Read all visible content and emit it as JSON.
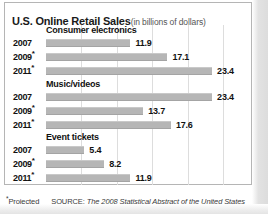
{
  "header": {
    "title_main": "U.S. Online Retail Sales",
    "title_sub": "(in billions of dollars)"
  },
  "footer": {
    "projected_star": "*",
    "projected_label": "Projected",
    "source_prefix": "SOURCE:",
    "source_title": "The 2008 Statistical Abstract of the United States"
  },
  "axis": {
    "max": 25.5,
    "gridlines": [
      5,
      10,
      15,
      20,
      25
    ]
  },
  "colors": {
    "bar": "#b6b6b6",
    "text": "#111111",
    "panel_border": "#b5b5b5",
    "gridline": "#dddddd"
  },
  "chart_data": {
    "type": "bar",
    "orientation": "horizontal",
    "xlabel": "",
    "ylabel": "",
    "unit": "billions of dollars",
    "xlim": [
      0,
      25.5
    ],
    "grid": true,
    "legend": "none",
    "source": "The 2008 Statistical Abstract of the United States",
    "note": "* Projected",
    "categories": [
      "2007",
      "2009*",
      "2011*"
    ],
    "groups": [
      {
        "name": "Consumer electronics",
        "rows": [
          {
            "year": "2007",
            "projected": false,
            "value": 11.9,
            "label": "11.9"
          },
          {
            "year": "2009",
            "projected": true,
            "value": 17.1,
            "label": "17.1"
          },
          {
            "year": "2011",
            "projected": true,
            "value": 23.4,
            "label": "23.4"
          }
        ]
      },
      {
        "name": "Music/videos",
        "rows": [
          {
            "year": "2007",
            "projected": false,
            "value": 23.4,
            "label": "23.4"
          },
          {
            "year": "2009",
            "projected": true,
            "value": 13.7,
            "label": "13.7"
          },
          {
            "year": "2011",
            "projected": true,
            "value": 17.6,
            "label": "17.6"
          }
        ]
      },
      {
        "name": "Event tickets",
        "rows": [
          {
            "year": "2007",
            "projected": false,
            "value": 5.4,
            "label": "5.4"
          },
          {
            "year": "2009",
            "projected": true,
            "value": 8.2,
            "label": "8.2"
          },
          {
            "year": "2011",
            "projected": true,
            "value": 11.9,
            "label": "11.9"
          }
        ]
      }
    ],
    "series": [
      {
        "name": "Consumer electronics",
        "values": [
          11.9,
          17.1,
          23.4
        ]
      },
      {
        "name": "Music/videos",
        "values": [
          23.4,
          13.7,
          17.6
        ]
      },
      {
        "name": "Event tickets",
        "values": [
          5.4,
          8.2,
          11.9
        ]
      }
    ]
  }
}
